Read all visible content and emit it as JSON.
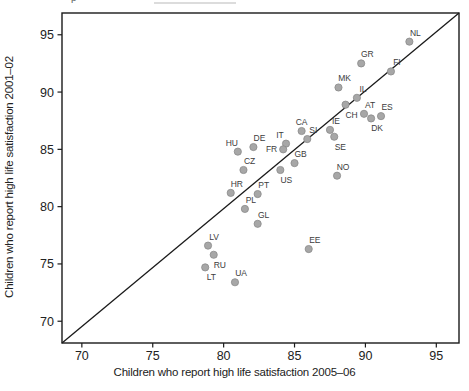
{
  "chart_data": {
    "type": "scatter",
    "title": "",
    "xlabel": "Children who report high life satisfaction 2005–06",
    "ylabel": "Children who report high life satisfaction 2001–02",
    "xlim": [
      68.6,
      96.6
    ],
    "ylim": [
      68.1,
      96.9
    ],
    "x_ticks": [
      70,
      75,
      80,
      85,
      90,
      95
    ],
    "y_ticks": [
      70,
      75,
      80,
      85,
      90,
      95
    ],
    "grid": false,
    "legend": false,
    "identity_line": true,
    "frame_color": "#1a1a1a",
    "line_color": "#1a1a1a",
    "dot_fill": "#a7a7a7",
    "dot_stroke": "#8a8a8a",
    "tick_label_color": "#222222",
    "point_label_color": "#3c3c3c",
    "points": [
      {
        "code": "NL",
        "x": 93.1,
        "y": 94.4,
        "lp": "ar"
      },
      {
        "code": "GR",
        "x": 89.7,
        "y": 92.5,
        "lp": "ar"
      },
      {
        "code": "FI",
        "x": 91.8,
        "y": 91.8,
        "lp": "ar"
      },
      {
        "code": "MK",
        "x": 88.1,
        "y": 90.4,
        "lp": "ar"
      },
      {
        "code": "IL",
        "x": 89.4,
        "y": 89.5,
        "lp": "ar"
      },
      {
        "code": "CH",
        "x": 88.6,
        "y": 88.9,
        "lp": "br"
      },
      {
        "code": "AT",
        "x": 89.9,
        "y": 88.1,
        "lp": "ar"
      },
      {
        "code": "ES",
        "x": 91.1,
        "y": 87.9,
        "lp": "ar"
      },
      {
        "code": "DK",
        "x": 90.4,
        "y": 87.7,
        "lp": "br"
      },
      {
        "code": "IE",
        "x": 87.5,
        "y": 86.7,
        "lp": "ar"
      },
      {
        "code": "SE",
        "x": 87.8,
        "y": 86.1,
        "lp": "br"
      },
      {
        "code": "CA",
        "x": 85.5,
        "y": 86.6,
        "lp": "a"
      },
      {
        "code": "SI",
        "x": 85.9,
        "y": 85.9,
        "lp": "ar"
      },
      {
        "code": "DE",
        "x": 82.1,
        "y": 85.2,
        "lp": "ar"
      },
      {
        "code": "HU",
        "x": 81.0,
        "y": 84.8,
        "lp": "al"
      },
      {
        "code": "IT",
        "x": 84.4,
        "y": 85.5,
        "lp": "al"
      },
      {
        "code": "FR",
        "x": 84.2,
        "y": 85.0,
        "lp": "l"
      },
      {
        "code": "GB",
        "x": 85.0,
        "y": 83.8,
        "lp": "ar"
      },
      {
        "code": "CZ",
        "x": 81.4,
        "y": 83.2,
        "lp": "ar"
      },
      {
        "code": "US",
        "x": 84.0,
        "y": 83.2,
        "lp": "br"
      },
      {
        "code": "NO",
        "x": 88.0,
        "y": 82.7,
        "lp": "ar"
      },
      {
        "code": "HR",
        "x": 80.5,
        "y": 81.2,
        "lp": "ar"
      },
      {
        "code": "PT",
        "x": 82.4,
        "y": 81.1,
        "lp": "ar"
      },
      {
        "code": "PL",
        "x": 81.5,
        "y": 79.8,
        "lp": "ar"
      },
      {
        "code": "GL",
        "x": 82.4,
        "y": 78.5,
        "lp": "ar"
      },
      {
        "code": "LV",
        "x": 78.9,
        "y": 76.6,
        "lp": "ar"
      },
      {
        "code": "RU",
        "x": 79.3,
        "y": 75.8,
        "lp": "br"
      },
      {
        "code": "EE",
        "x": 86.0,
        "y": 76.3,
        "lp": "ar"
      },
      {
        "code": "LT",
        "x": 78.7,
        "y": 74.7,
        "lp": "br"
      },
      {
        "code": "UA",
        "x": 80.8,
        "y": 73.4,
        "lp": "ar"
      }
    ]
  }
}
